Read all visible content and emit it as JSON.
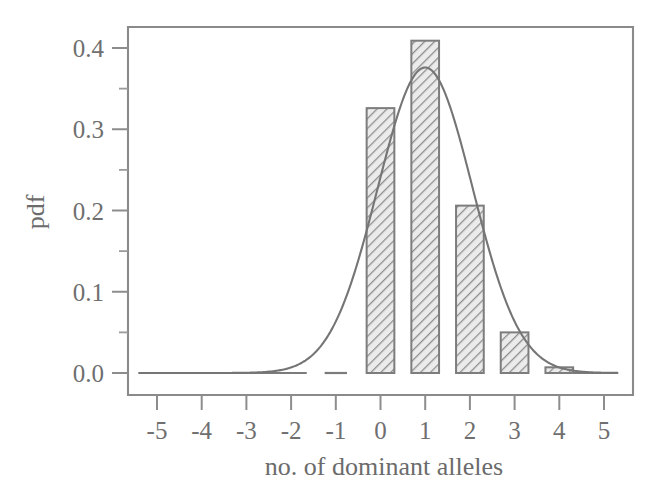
{
  "chart_data": {
    "type": "bar",
    "title": "",
    "subtitle": "",
    "xlabel": "no. of dominant alleles",
    "ylabel": "pdf",
    "xlim": [
      -5.6,
      5.4
    ],
    "ylim": [
      0.0,
      0.43
    ],
    "grid": false,
    "legend": null,
    "categories": [
      0,
      1,
      2,
      3,
      4
    ],
    "values": [
      0.326,
      0.409,
      0.206,
      0.05,
      0.007
    ],
    "bar_width": 0.62,
    "x_ticks": [
      "-5",
      "-4",
      "-3",
      "-2",
      "-1",
      "0",
      "1",
      "2",
      "3",
      "4",
      "5"
    ],
    "x_tick_values": [
      -5,
      -4,
      -3,
      -2,
      -1,
      0,
      1,
      2,
      3,
      4,
      5
    ],
    "y_ticks": [
      "0.0",
      "0.1",
      "0.2",
      "0.3",
      "0.4"
    ],
    "y_tick_values": [
      0.0,
      0.1,
      0.2,
      0.3,
      0.4
    ],
    "y_minor_tick_values": [
      0.05,
      0.15,
      0.25,
      0.35
    ],
    "series": [
      {
        "name": "binomial pdf",
        "type": "bar",
        "categories": [
          0,
          1,
          2,
          3,
          4
        ],
        "values": [
          0.326,
          0.409,
          0.206,
          0.05,
          0.007
        ]
      },
      {
        "name": "normal approximation",
        "type": "line",
        "mean": 1.0,
        "sigma": 1.06,
        "peak": 0.376,
        "x_range": [
          -5.4,
          5.3
        ]
      }
    ],
    "baseline_segments": [
      {
        "x_start": -5.3,
        "x_end": -1.65,
        "y": 0.0
      },
      {
        "x_start": -1.25,
        "x_end": -0.75,
        "y": 0.0
      },
      {
        "x_start": 4.25,
        "x_end": 5.3,
        "y": 0.0
      }
    ]
  },
  "axes": {
    "y_axis_title": "pdf",
    "x_axis_title": "no. of dominant alleles"
  },
  "colors": {
    "ink": "#6f6f6f",
    "frame": "#8a8a8a",
    "bar_fill_hatch": "#8e8e8e",
    "bar_face": "#e2e2e2",
    "curve": "#757575",
    "background": "#ffffff"
  }
}
